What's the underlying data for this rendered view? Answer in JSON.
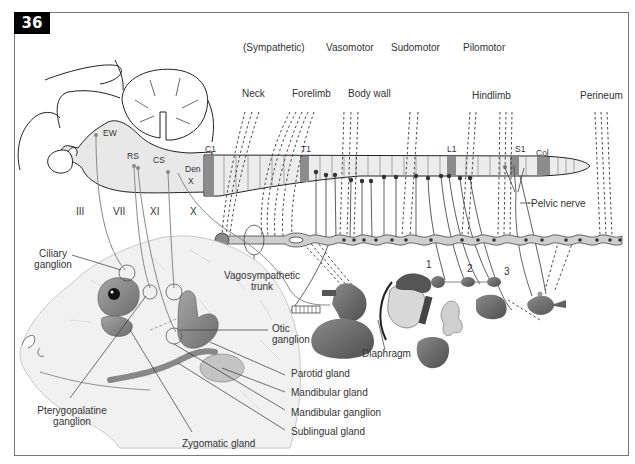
{
  "figure": {
    "number": "36"
  },
  "headers": {
    "sympathetic": "(Sympathetic)",
    "vasomotor": "Vasomotor",
    "sudomotor": "Sudomotor",
    "pilomotor": "Pilomotor"
  },
  "regions": {
    "neck": "Neck",
    "forelimb": "Forelimb",
    "body_wall": "Body wall",
    "hindlimb": "Hindlimb",
    "perineum": "Perineum"
  },
  "spinal_segments": {
    "c1": "C1",
    "t1": "T1",
    "l1": "L1",
    "s1": "S1",
    "col": "Col"
  },
  "brainstem_nuclei": {
    "ew": "EW",
    "rs": "RS",
    "cs": "CS",
    "den": "Den",
    "x": "X"
  },
  "cranial_nerves": {
    "iii": "III",
    "vii": "VII",
    "xi": "XI",
    "x": "X"
  },
  "labels": {
    "ciliary_ganglion": [
      "Ciliary",
      "ganglion"
    ],
    "vagosympathetic_trunk": [
      "Vagosympathetic",
      "trunk"
    ],
    "pelvic_nerve": "Pelvic nerve",
    "otic_ganglion": [
      "Otic",
      "ganglion"
    ],
    "diaphragm": "Diaphragm",
    "parotid_gland": "Parotid gland",
    "mandibular_gland": "Mandibular gland",
    "mandibular_ganglion": "Mandibular ganglion",
    "sublingual_gland": "Sublingual gland",
    "pterygopalatine_ganglion": [
      "Pterygopalatine",
      "ganglion"
    ],
    "zygomatic_gland": "Zygomatic gland"
  },
  "ganglion_numbers": [
    "1",
    "2",
    "3"
  ],
  "colors": {
    "line": "#333333",
    "organ_dark": "#6a6a6a",
    "organ_mid": "#9a9a9a",
    "tissue_light": "#e6e6e6",
    "segment_dark": "#8c8c8c",
    "chain": "#cfcfcf",
    "badge": "#000000"
  }
}
